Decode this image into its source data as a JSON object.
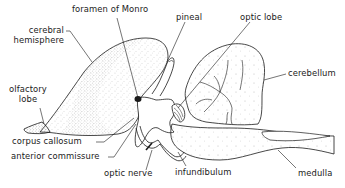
{
  "diagram": {
    "ink_color": "#1a1a1a",
    "background": "#ffffff",
    "labels": {
      "foramen_of_monro": "foramen of Monro",
      "pineal": "pineal",
      "optic_lobe": "optic lobe",
      "cerebral_hemisphere_line1": "cerebral",
      "cerebral_hemisphere_line2": "hemisphere",
      "cerebellum": "cerebellum",
      "olfactory_lobe_line1": "olfactory",
      "olfactory_lobe_line2": "lobe",
      "corpus_callosum": "corpus callosum",
      "anterior_commissure": "anterior commissure",
      "optic_nerve": "optic nerve",
      "infundibulum": "infundibulum",
      "medulla": "medulla"
    }
  }
}
